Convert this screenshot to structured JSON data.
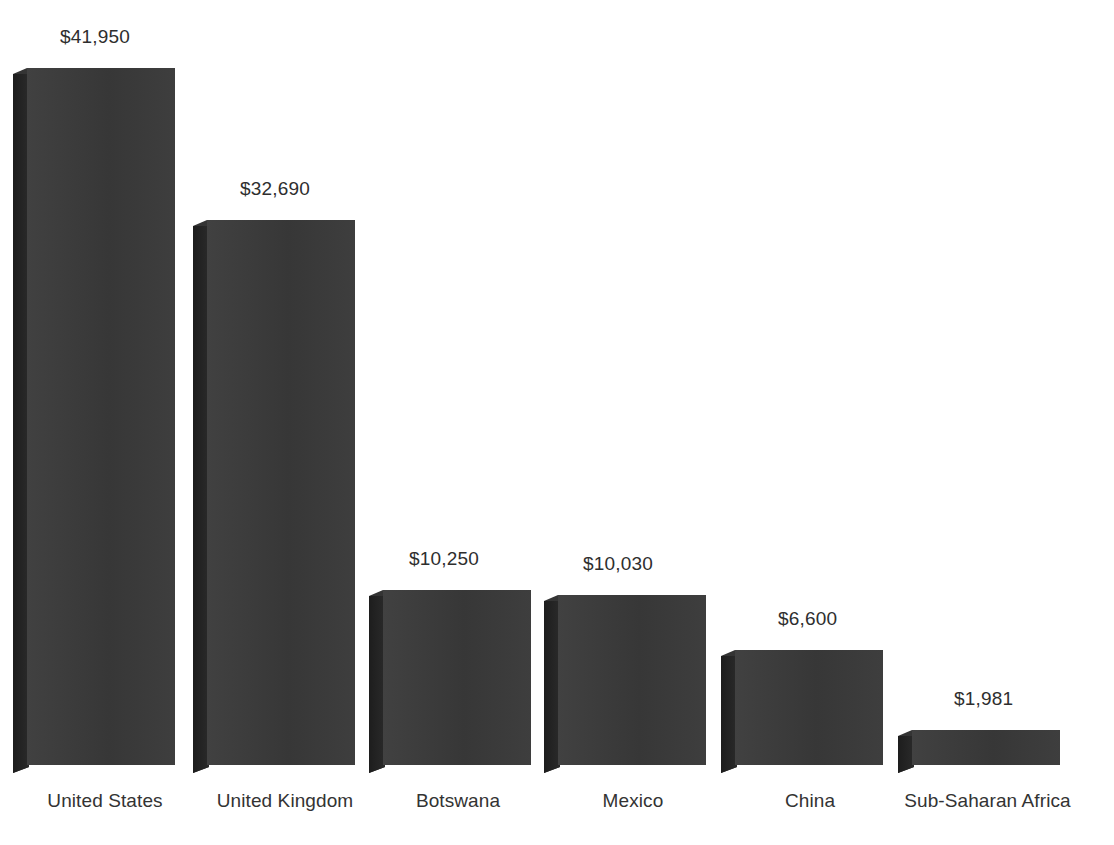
{
  "chart_data": {
    "type": "bar",
    "title": "",
    "subtitle": "",
    "xlabel": "",
    "ylabel": "",
    "grid": false,
    "legend": false,
    "legend_position": "none",
    "currency": "USD",
    "value_prefix": "$",
    "ylim": [
      0,
      41950
    ],
    "categories": [
      "United States",
      "United Kingdom",
      "Botswana",
      "Mexico",
      "China",
      "Sub-Saharan Africa"
    ],
    "values": [
      41950,
      32690,
      10250,
      10030,
      6600,
      1981
    ],
    "value_labels": [
      "$41,950",
      "$32,690",
      "$10,250",
      "$10,030",
      "$6,600",
      "$1,981"
    ],
    "series": [
      {
        "name": "",
        "values": [
          41950,
          32690,
          10250,
          10030,
          6600,
          1981
        ]
      }
    ],
    "style": {
      "bar_face_color": "#3a3a3a",
      "bar_side_color": "#242424",
      "bar_top_color": "#343434",
      "background_color": "#ffffff",
      "label_color": "#333333",
      "three_dimensional": true
    }
  },
  "layout": {
    "baseline_y": 765,
    "bar_width": 148,
    "depth_x": 14,
    "depth_y": 6,
    "bars": [
      {
        "left": 27,
        "top": 68,
        "label_left": 60,
        "label_top": 26,
        "cat_left": 0,
        "cat_width": 210,
        "cat_top": 790
      },
      {
        "left": 207,
        "top": 220,
        "label_left": 240,
        "label_top": 178,
        "cat_left": 180,
        "cat_width": 210,
        "cat_top": 790
      },
      {
        "left": 383,
        "top": 590,
        "label_left": 409,
        "label_top": 548,
        "cat_left": 360,
        "cat_width": 196,
        "cat_top": 790
      },
      {
        "left": 558,
        "top": 595,
        "label_left": 583,
        "label_top": 553,
        "cat_left": 535,
        "cat_width": 196,
        "cat_top": 790
      },
      {
        "left": 735,
        "top": 650,
        "label_left": 778,
        "label_top": 608,
        "cat_left": 712,
        "cat_width": 196,
        "cat_top": 790
      },
      {
        "left": 912,
        "top": 730,
        "label_left": 954,
        "label_top": 688,
        "cat_left": 880,
        "cat_width": 215,
        "cat_top": 790
      }
    ]
  }
}
